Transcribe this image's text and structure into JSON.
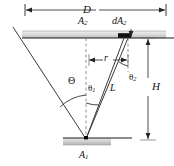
{
  "figure": {
    "background_color": "#ffffff",
    "line_color": "#333333",
    "plate_fill_top": "#d9d9d9",
    "plate_fill_bottom": "#c9c9c9",
    "accent_color": "#000000"
  },
  "labels": {
    "D": "D",
    "A2": "A",
    "A2_sub": "2",
    "dA2": "dA",
    "dA2_sub": "2",
    "r": "r",
    "theta2": "θ",
    "theta2_sub": "2",
    "H": "H",
    "Theta": "Θ",
    "theta1": "θ",
    "theta1_sub": "1",
    "L": "L",
    "A1": "A",
    "A1_sub": "1"
  },
  "geometry": {
    "apex": {
      "x": 86,
      "y": 139
    },
    "top_plate": {
      "x1": 22,
      "y1": 31,
      "x2": 166,
      "y2": 38
    },
    "bottom_plate": {
      "x1": 63,
      "y1": 138,
      "x2": 111,
      "y2": 145
    },
    "dimension_D": {
      "x1": 25,
      "x2": 166,
      "y": 10
    },
    "dimension_H": {
      "x": 148,
      "y1": 38,
      "y2": 140
    },
    "dimension_r": {
      "x1": 89,
      "x2": 128,
      "y": 60
    },
    "cone_left_top": {
      "x": 13,
      "y": 27
    },
    "cone_right_top": {
      "x": 128,
      "y": 38
    },
    "centerline": {
      "x": 86,
      "y1": 38,
      "y2": 139
    },
    "dA2_element": {
      "x1": 118,
      "x2": 131,
      "y": 34
    }
  }
}
